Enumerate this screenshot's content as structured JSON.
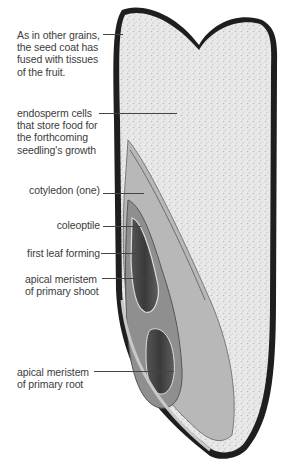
{
  "figure": {
    "labels": [
      {
        "id": "seed-coat",
        "lines": [
          "As in other grains,",
          "the seed coat has",
          "fused with tissues",
          "of the fruit."
        ]
      },
      {
        "id": "endosperm",
        "lines": [
          "endosperm cells",
          "that store food for",
          "the forthcoming",
          "seedling's growth"
        ]
      },
      {
        "id": "cotyledon",
        "lines": [
          "cotyledon (one)"
        ]
      },
      {
        "id": "coleoptile",
        "lines": [
          "coleoptile"
        ]
      },
      {
        "id": "first-leaf",
        "lines": [
          "first leaf forming"
        ]
      },
      {
        "id": "apical-shoot",
        "lines": [
          "apical meristem",
          "of primary shoot"
        ]
      },
      {
        "id": "apical-root",
        "lines": [
          "apical meristem",
          "of primary root"
        ]
      }
    ]
  }
}
